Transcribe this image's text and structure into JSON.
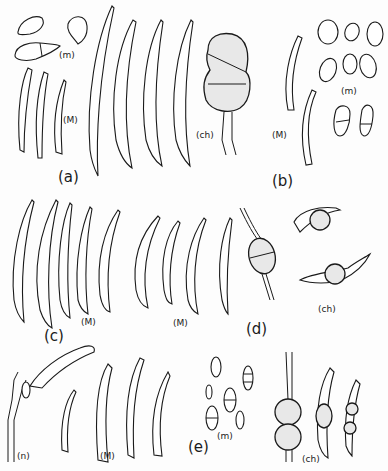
{
  "figure": {
    "panels": [
      {
        "id": "a",
        "label": "(a)",
        "parts": [
          {
            "label": "(m)",
            "kind": "microconidia"
          },
          {
            "label": "(M)",
            "kind": "macroconidia"
          },
          {
            "label": "(ch)",
            "kind": "chlamydospore"
          }
        ]
      },
      {
        "id": "b",
        "label": "(b)",
        "parts": [
          {
            "label": "(M)",
            "kind": "macroconidia"
          },
          {
            "label": "(m)",
            "kind": "microconidia"
          }
        ]
      },
      {
        "id": "c",
        "label": "(c)",
        "parts": [
          {
            "label": "(M)",
            "kind": "macroconidia"
          }
        ]
      },
      {
        "id": "d",
        "label": "(d)",
        "parts": [
          {
            "label": "(M)",
            "kind": "macroconidia"
          },
          {
            "label": "(ch)",
            "kind": "chlamydospores"
          }
        ]
      },
      {
        "id": "e",
        "label": "(e)",
        "parts": [
          {
            "label": "(n)",
            "kind": "conidiophore"
          },
          {
            "label": "(M)",
            "kind": "macroconidia"
          },
          {
            "label": "(m)",
            "kind": "microconidia"
          },
          {
            "label": "(ch)",
            "kind": "chlamydospores"
          }
        ]
      }
    ]
  },
  "labels": {
    "a_m": "(m)",
    "a_M": "(M)",
    "a_ch": "(ch)",
    "a": "(a)",
    "b_M": "(M)",
    "b_m": "(m)",
    "b": "(b)",
    "c_M": "(M)",
    "c": "(c)",
    "d_M": "(M)",
    "d_ch": "(ch)",
    "d": "(d)",
    "e_n": "(n)",
    "e_M": "(M)",
    "e_m": "(m)",
    "e_ch": "(ch)",
    "e": "(e)"
  }
}
